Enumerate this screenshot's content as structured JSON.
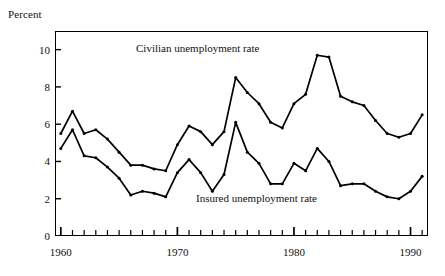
{
  "figure": {
    "y_axis_title": "Percent"
  },
  "annotations": {
    "civilian": "Civilian  unemployment  rate",
    "insured": "Insured unemployment  rate"
  },
  "chart_data": {
    "type": "line",
    "title": "",
    "subtitle": "",
    "xlabel": "",
    "ylabel": "Percent",
    "xlim": [
      1959.5,
      1991.5
    ],
    "ylim": [
      0,
      11
    ],
    "grid": false,
    "legend": "inline-annotations",
    "y_ticks": [
      0,
      2,
      4,
      6,
      8,
      10
    ],
    "y_tick_labels": [
      "0",
      "2",
      "4",
      "6",
      "8",
      "10"
    ],
    "x_ticks": [
      1960,
      1970,
      1980,
      1990
    ],
    "x_tick_labels": [
      "1960",
      "1970",
      "1980",
      "1990"
    ],
    "x_minor_ticks": [
      1961,
      1962,
      1963,
      1964,
      1965,
      1966,
      1967,
      1968,
      1969,
      1971,
      1972,
      1973,
      1974,
      1975,
      1976,
      1977,
      1978,
      1979,
      1981,
      1982,
      1983,
      1984,
      1985,
      1986,
      1987,
      1988,
      1989,
      1991
    ],
    "x": [
      1960,
      1961,
      1962,
      1963,
      1964,
      1965,
      1966,
      1967,
      1968,
      1969,
      1970,
      1971,
      1972,
      1973,
      1974,
      1975,
      1976,
      1977,
      1978,
      1979,
      1980,
      1981,
      1982,
      1983,
      1984,
      1985,
      1986,
      1987,
      1988,
      1989,
      1990,
      1991
    ],
    "series": [
      {
        "name": "Civilian  unemployment  rate",
        "color": "#000000",
        "values": [
          5.5,
          6.7,
          5.5,
          5.7,
          5.2,
          4.5,
          3.8,
          3.8,
          3.6,
          3.5,
          4.9,
          5.9,
          5.6,
          4.9,
          5.6,
          8.5,
          7.7,
          7.1,
          6.1,
          5.8,
          7.1,
          7.6,
          9.7,
          9.6,
          7.5,
          7.2,
          7.0,
          6.2,
          5.5,
          5.3,
          5.5,
          6.5
        ]
      },
      {
        "name": "Insured unemployment  rate",
        "color": "#000000",
        "values": [
          4.7,
          5.7,
          4.3,
          4.2,
          3.7,
          3.1,
          2.2,
          2.4,
          2.3,
          2.1,
          3.4,
          4.1,
          3.4,
          2.4,
          3.3,
          6.1,
          4.5,
          3.9,
          2.8,
          2.8,
          3.9,
          3.5,
          4.7,
          4.0,
          2.7,
          2.8,
          2.8,
          2.4,
          2.1,
          2.0,
          2.4,
          3.2
        ]
      }
    ]
  }
}
